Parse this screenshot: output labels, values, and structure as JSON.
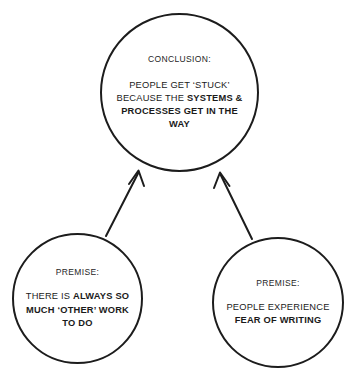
{
  "diagram": {
    "type": "argument-map",
    "background_color": "#ffffff",
    "stroke_color": "#1c1c1c",
    "nodes": [
      {
        "id": "conclusion",
        "header": "CONCLUSION:",
        "body_segments": [
          {
            "text": "PEOPLE GET ‘STUCK’ BECAUSE THE ",
            "bold": false
          },
          {
            "text": "SYSTEMS & PROCESSES GET IN THE WAY",
            "bold": true
          }
        ],
        "body_plain": "PEOPLE GET ‘STUCK’ BECAUSE THE SYSTEMS & PROCESSES GET IN THE WAY"
      },
      {
        "id": "premise-left",
        "header": "PREMISE:",
        "body_segments": [
          {
            "text": "THERE IS ",
            "bold": false
          },
          {
            "text": "ALWAYS SO MUCH ‘OTHER’ WORK TO DO",
            "bold": true
          }
        ],
        "body_plain": "THERE IS ALWAYS SO MUCH ‘OTHER’ WORK TO DO"
      },
      {
        "id": "premise-right",
        "header": "PREMISE:",
        "body_segments": [
          {
            "text": "PEOPLE EXPERIENCE ",
            "bold": false
          },
          {
            "text": "FEAR OF WRITING",
            "bold": true
          }
        ],
        "body_plain": "PEOPLE EXPERIENCE FEAR OF WRITING"
      }
    ],
    "edges": [
      {
        "id": "edge-left",
        "from": "premise-left",
        "to": "conclusion",
        "style": "solid-arrow"
      },
      {
        "id": "edge-right",
        "from": "premise-right",
        "to": "conclusion",
        "style": "solid-arrow"
      }
    ]
  }
}
